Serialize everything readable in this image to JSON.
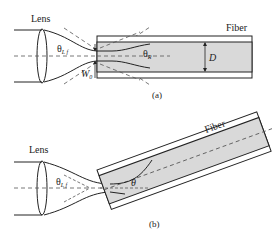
{
  "panel_a": {
    "lens_label": "Lens",
    "fiber_label": "Fiber",
    "theta_lf": "θ",
    "theta_lf_sub": "L f",
    "theta_r": "θ",
    "theta_r_sub": "R",
    "w0": "W",
    "w0_sub": "0",
    "d_label": "D",
    "caption": "(a)"
  },
  "panel_b": {
    "lens_label": "Lens",
    "fiber_label": "Fiber",
    "theta_lf": "θ",
    "theta_lf_sub": "L f",
    "theta": "θ",
    "caption": "(b)"
  },
  "colors": {
    "line": "#222222",
    "core_fill": "#d9d9d9",
    "dash": "#555555"
  }
}
